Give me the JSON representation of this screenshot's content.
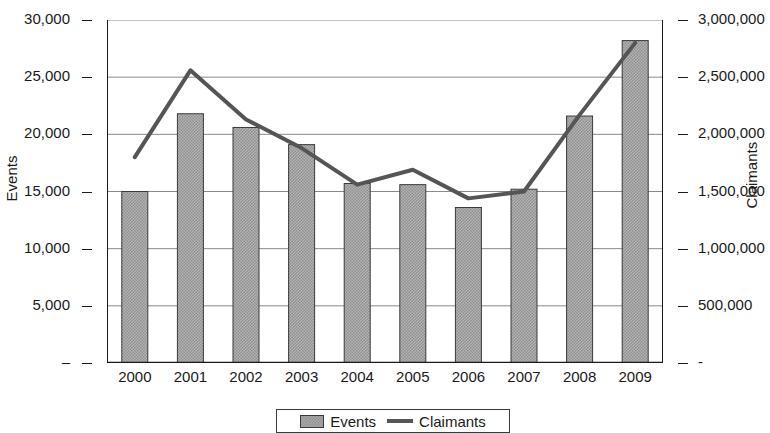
{
  "chart_data": {
    "type": "bar",
    "title": "",
    "xlabel": "",
    "categories": [
      "2000",
      "2001",
      "2002",
      "2003",
      "2004",
      "2005",
      "2006",
      "2007",
      "2008",
      "2009"
    ],
    "series": [
      {
        "name": "Events",
        "type": "bar",
        "axis": "left",
        "values": [
          15000,
          21800,
          20600,
          19100,
          15700,
          15600,
          13600,
          15200,
          21600,
          28200
        ]
      },
      {
        "name": "Claimants",
        "type": "line",
        "axis": "right",
        "values": [
          1800000,
          2560000,
          2130000,
          1880000,
          1560000,
          1690000,
          1440000,
          1500000,
          2170000,
          2800000
        ]
      }
    ],
    "left_axis": {
      "label": "Events",
      "ylim": [
        0,
        30000
      ],
      "ticks": [
        0,
        5000,
        10000,
        15000,
        20000,
        25000,
        30000
      ],
      "tick_labels": [
        "–",
        "5,000",
        "10,000",
        "15,000",
        "20,000",
        "25,000",
        "30,000"
      ]
    },
    "right_axis": {
      "label": "Claimants",
      "ylim": [
        0,
        3000000
      ],
      "ticks": [
        0,
        500000,
        1000000,
        1500000,
        2000000,
        2500000,
        3000000
      ],
      "tick_labels": [
        "-",
        "500,000",
        "1,000,000",
        "1,500,000",
        "2,000,000",
        "2,500,000",
        "3,000,000"
      ]
    },
    "grid": true,
    "legend": {
      "position": "bottom-center",
      "entries": [
        {
          "label": "Events",
          "marker": "bar-swatch",
          "color": "#a8a8a8"
        },
        {
          "label": "Claimants",
          "marker": "line-swatch",
          "color": "#555555"
        }
      ]
    },
    "colors": {
      "bar_fill": "#a8a8a8",
      "bar_border": "#3a3a3a",
      "line": "#555555",
      "grid": "#8a8a8a",
      "axis": "#1a1a1a",
      "background": "#ffffff"
    }
  }
}
